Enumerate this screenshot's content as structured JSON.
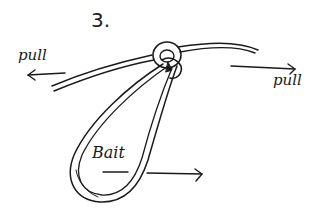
{
  "diagram": {
    "step_number": "3.",
    "labels": {
      "pull_left": "pull",
      "pull_right": "pull",
      "bait": "Bait"
    },
    "ink_color": "#1a1a1a",
    "background_color": "#ffffff",
    "elements": [
      {
        "name": "main-line",
        "description": "curved double-stroke fishing line running left to right"
      },
      {
        "name": "knot",
        "description": "small ring/wrap knot at center top"
      },
      {
        "name": "bait-loop",
        "description": "elongated teardrop loop hanging below the knot"
      },
      {
        "name": "arrow-left",
        "description": "arrow pointing left under 'pull'"
      },
      {
        "name": "arrow-right",
        "description": "arrow pointing right above 'pull'"
      },
      {
        "name": "arrow-bait",
        "description": "arrow from loop pointing right"
      }
    ]
  }
}
